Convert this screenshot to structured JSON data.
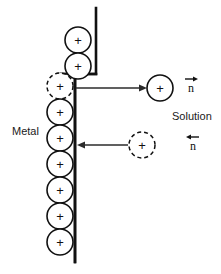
{
  "figure": {
    "background_color": "#ffffff",
    "ink_color": "#111111",
    "width": 221,
    "height": 274
  },
  "labels": {
    "metal": "Metal",
    "solution": "Solution",
    "flux_out": "n",
    "flux_in": "n"
  },
  "ions": {
    "charge_sign": "+",
    "lattice_ions": [
      {
        "id": "top-1",
        "cx": 78,
        "cy": 40,
        "r": 13,
        "style": "solid",
        "sign": "+"
      },
      {
        "id": "top-2",
        "cx": 78,
        "cy": 66,
        "r": 13,
        "style": "solid",
        "sign": "+"
      },
      {
        "id": "col-1",
        "cx": 60,
        "cy": 86,
        "r": 13,
        "style": "dashed",
        "sign": "+"
      },
      {
        "id": "col-2",
        "cx": 60,
        "cy": 112,
        "r": 13,
        "style": "solid",
        "sign": "+"
      },
      {
        "id": "col-3",
        "cx": 60,
        "cy": 138,
        "r": 13,
        "style": "solid",
        "sign": "+"
      },
      {
        "id": "col-4",
        "cx": 60,
        "cy": 164,
        "r": 13,
        "style": "solid",
        "sign": "+"
      },
      {
        "id": "col-5",
        "cx": 60,
        "cy": 190,
        "r": 13,
        "style": "solid",
        "sign": "+"
      },
      {
        "id": "col-6",
        "cx": 60,
        "cy": 216,
        "r": 13,
        "style": "solid",
        "sign": "+"
      },
      {
        "id": "col-7",
        "cx": 60,
        "cy": 242,
        "r": 13,
        "style": "solid",
        "sign": "+"
      }
    ],
    "solution_ions": [
      {
        "id": "sol-dissolved",
        "cx": 160,
        "cy": 88,
        "r": 13,
        "style": "solid",
        "sign": "+"
      },
      {
        "id": "sol-depositing",
        "cx": 142,
        "cy": 145,
        "r": 13,
        "style": "dashed",
        "sign": "+"
      }
    ]
  },
  "arrows": {
    "dissolution": {
      "direction": "right",
      "x1": 76,
      "y1": 88,
      "x2": 146,
      "y2": 88
    },
    "deposition": {
      "direction": "left",
      "x1": 128,
      "y1": 145,
      "x2": 77,
      "y2": 145
    }
  },
  "vectors": {
    "out": {
      "letter": "n",
      "x": 191,
      "y": 92,
      "arrow_direction": "right"
    },
    "in": {
      "letter": "n",
      "x": 193,
      "y": 150,
      "arrow_direction": "left"
    }
  },
  "label_positions": {
    "metal": {
      "x": 12,
      "y": 135
    },
    "solution": {
      "x": 172,
      "y": 120
    }
  }
}
